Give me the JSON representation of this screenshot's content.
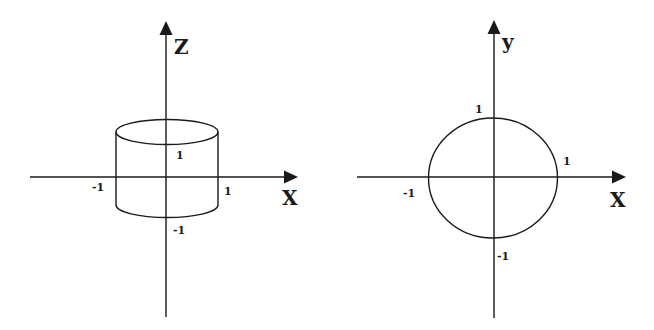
{
  "figure": {
    "left_panel": {
      "title": "Cylinder x^2 + y^2 = 1 viewed in the xz-plane",
      "axes": {
        "horizontal_label": "X",
        "vertical_label": "Z"
      },
      "ticks": {
        "x_neg": "-1",
        "x_pos": "1",
        "z_pos": "1",
        "z_neg": "-1"
      },
      "shape": "cylinder"
    },
    "right_panel": {
      "title": "Circle x^2 + y^2 = 1 in the xy-plane",
      "axes": {
        "horizontal_label": "X",
        "vertical_label": "y"
      },
      "ticks": {
        "x_neg": "-1",
        "x_pos": "1",
        "y_pos": "1",
        "y_neg": "-1"
      },
      "shape": "circle"
    },
    "colors": {
      "ink": "#1a1a1a",
      "background": "#ffffff"
    }
  }
}
